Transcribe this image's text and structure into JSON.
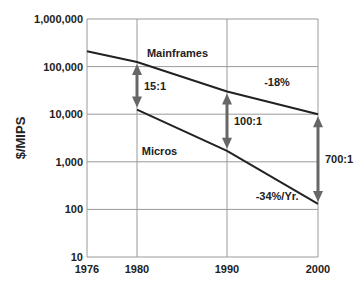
{
  "chart_data": {
    "type": "line",
    "title": "",
    "xlabel": "",
    "ylabel": "$/MIPS",
    "yscale": "log",
    "ylim": [
      10,
      1000000
    ],
    "xlim": [
      1976,
      2000
    ],
    "x_ticks": [
      "1976",
      "1980",
      "1990",
      "2000"
    ],
    "x_tick_values": [
      1976,
      1980,
      1990,
      2000
    ],
    "y_ticks": [
      "10",
      "100",
      "1,000",
      "10,000",
      "100,000",
      "1,000,000"
    ],
    "y_tick_values": [
      10,
      100,
      1000,
      10000,
      100000,
      1000000
    ],
    "grid": true,
    "series": [
      {
        "name": "Mainframes",
        "x": [
          1976,
          1980,
          1990,
          2000
        ],
        "values": [
          210000,
          125000,
          30000,
          10000
        ],
        "color": "#222222"
      },
      {
        "name": "Micros",
        "x": [
          1980,
          1990,
          2000
        ],
        "values": [
          12500,
          1700,
          130
        ],
        "color": "#222222"
      }
    ],
    "annotations": [
      {
        "text": "Mainframes",
        "kind": "series-label",
        "x": 1984.5,
        "y": 160000
      },
      {
        "text": "Micros",
        "kind": "series-label",
        "x": 1982.5,
        "y": 1400
      },
      {
        "text": "-18%",
        "kind": "rate-label",
        "x": 1995.5,
        "y": 40000
      },
      {
        "text": "-34%/Yr.",
        "kind": "rate-label",
        "x": 1995.5,
        "y": 160
      },
      {
        "text": "15:1",
        "kind": "ratio-arrow",
        "x": 1980,
        "from": 125000,
        "to": 12500
      },
      {
        "text": "100:1",
        "kind": "ratio-arrow",
        "x": 1990,
        "from": 30000,
        "to": 1700
      },
      {
        "text": "700:1",
        "kind": "ratio-arrow",
        "x": 2000,
        "from": 10000,
        "to": 130
      }
    ],
    "colors": {
      "grid": "#9a9a9a",
      "line": "#222222",
      "arrow": "#666666"
    }
  }
}
